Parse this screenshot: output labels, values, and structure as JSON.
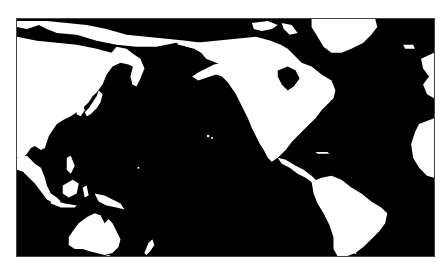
{
  "map": {
    "title": "Pacific-centered world map",
    "projection": "equirectangular (Pacific-centered)",
    "colors": {
      "ocean": "#000000",
      "land": "#ffffff",
      "background": "#ffffff",
      "frame": "#444444"
    },
    "regions": [
      {
        "name": "Asia",
        "id": "asia"
      },
      {
        "name": "Arctic coastline / Siberia",
        "id": "siberia"
      },
      {
        "name": "Japan",
        "id": "japan"
      },
      {
        "name": "Southeast Asia / Indonesia",
        "id": "se-asia"
      },
      {
        "name": "Philippines",
        "id": "philippines"
      },
      {
        "name": "New Guinea",
        "id": "new-guinea"
      },
      {
        "name": "Australia",
        "id": "australia"
      },
      {
        "name": "New Zealand",
        "id": "new-zealand"
      },
      {
        "name": "Alaska",
        "id": "alaska"
      },
      {
        "name": "North America",
        "id": "north-america"
      },
      {
        "name": "Canadian Arctic Islands",
        "id": "arctic-islands"
      },
      {
        "name": "Greenland",
        "id": "greenland"
      },
      {
        "name": "Central America",
        "id": "central-america"
      },
      {
        "name": "Caribbean",
        "id": "caribbean"
      },
      {
        "name": "South America",
        "id": "south-america"
      },
      {
        "name": "West Africa (edge)",
        "id": "africa"
      },
      {
        "name": "Iceland / Europe (edge)",
        "id": "europe"
      },
      {
        "name": "Hawaii",
        "id": "hawaii"
      }
    ]
  }
}
